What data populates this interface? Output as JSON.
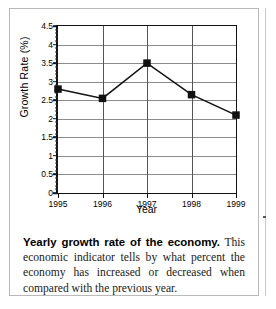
{
  "chart_data": {
    "type": "line",
    "title": "",
    "xlabel": "Year",
    "ylabel": "Growth Rate (%)",
    "categories": [
      "1995",
      "1996",
      "1997",
      "1998",
      "1999"
    ],
    "values": [
      2.8,
      2.55,
      3.5,
      2.65,
      2.1
    ],
    "ylim": [
      0,
      4.5
    ],
    "ytick_labels": [
      "0",
      "0.5",
      "1",
      "1.5",
      "2",
      "2.5",
      "3",
      "3.5",
      "4",
      "4.5"
    ],
    "ytick_values": [
      0,
      0.5,
      1,
      1.5,
      2,
      2.5,
      3,
      3.5,
      4,
      4.5
    ],
    "ytick_minor_step": 0.1,
    "grid": "horizontal-and-vertical",
    "legend": "none",
    "marker": "square",
    "series": [
      {
        "name": "Growth Rate (%)",
        "values": [
          2.8,
          2.55,
          3.5,
          2.65,
          2.1
        ],
        "color": "#111111"
      }
    ]
  },
  "caption": {
    "lead": "Yearly growth rate of the economy.",
    "body": "This economic indicator tells by what percent the economy has increased or decreased when compared with the previous year."
  }
}
